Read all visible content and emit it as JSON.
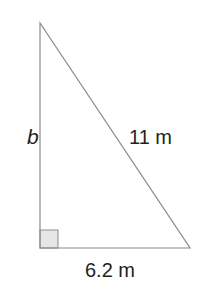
{
  "diagram": {
    "type": "right-triangle",
    "labels": {
      "vertical_side": "b",
      "hypotenuse": "11 m",
      "base": "6.2 m"
    },
    "right_angle_marker": true,
    "colors": {
      "stroke": "#8a8a8a",
      "marker_fill": "#e6e6e6",
      "text": "#231f20"
    }
  }
}
